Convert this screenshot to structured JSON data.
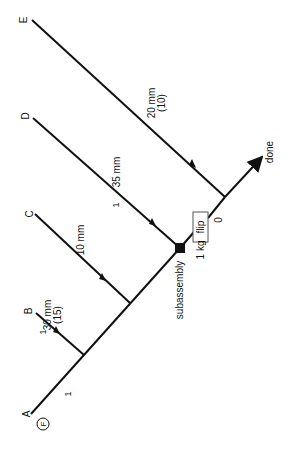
{
  "diagram": {
    "type": "assembly-tree",
    "orientation": "rotated-90",
    "inputs": [
      {
        "id": "A",
        "label": "A",
        "badge": "F",
        "edge_label": "1"
      },
      {
        "id": "B",
        "label": "B",
        "edge_label": "1",
        "dimension": "30 mm",
        "count": "(15)"
      },
      {
        "id": "C",
        "label": "C",
        "dimension": "10 mm"
      },
      {
        "id": "D",
        "label": "D",
        "edge_label": "1",
        "dimension": "35 mm"
      },
      {
        "id": "E",
        "label": "E",
        "dimension": "20 mm",
        "count": "(10)"
      }
    ],
    "subassembly": {
      "label": "subassembly",
      "weight": "1 kg"
    },
    "operation": {
      "label": "flip",
      "value": "0"
    },
    "output": {
      "label": "done"
    },
    "colors": {
      "line": "#111111",
      "background": "#ffffff"
    }
  }
}
